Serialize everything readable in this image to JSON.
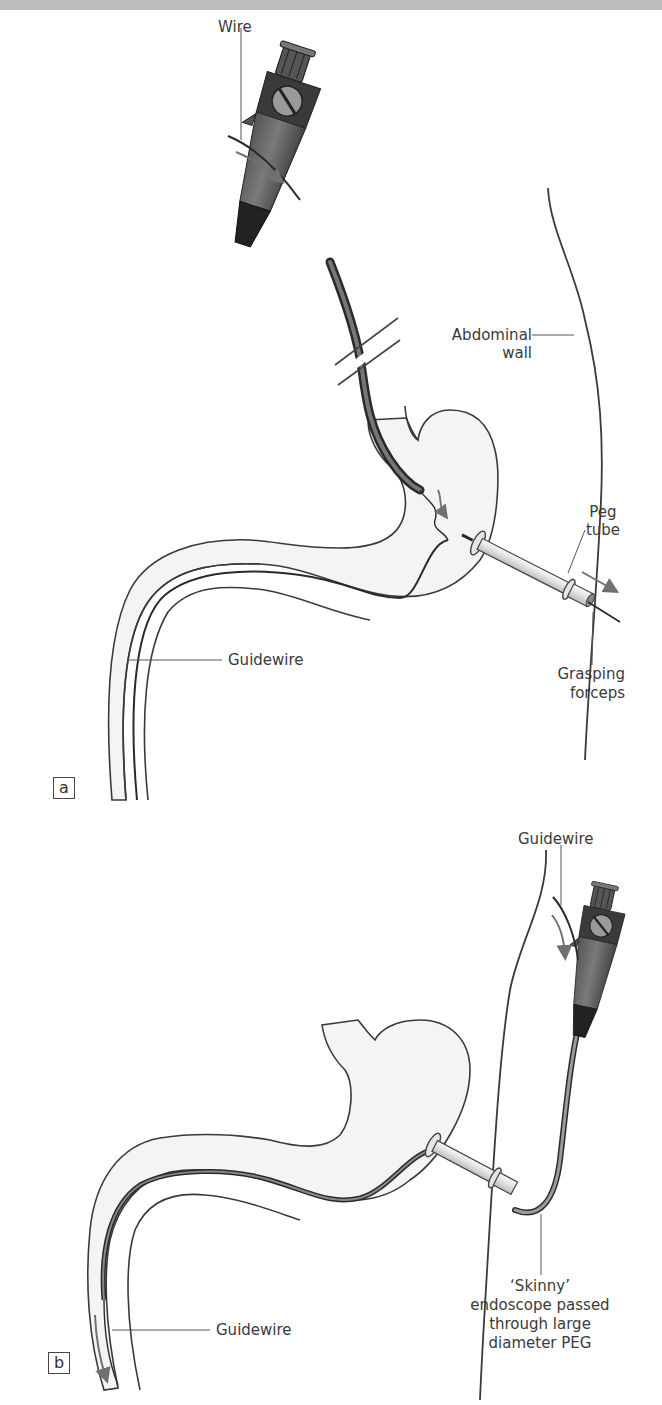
{
  "figure": {
    "panels": [
      {
        "id": "a",
        "tag": "a",
        "labels": {
          "wire": "Wire",
          "abdominal_wall_line1": "Abdominal",
          "abdominal_wall_line2": "wall",
          "peg_tube_line1": "Peg",
          "peg_tube_line2": "tube",
          "grasping_forceps_line1": "Grasping",
          "grasping_forceps_line2": "forceps",
          "guidewire": "Guidewire"
        }
      },
      {
        "id": "b",
        "tag": "b",
        "labels": {
          "guidewire_top": "Guidewire",
          "guidewire_bottom": "Guidewire",
          "skinny_line1": "‘Skinny’",
          "skinny_line2": "endoscope passed",
          "skinny_line3": "through large",
          "skinny_line4": "diameter PEG"
        }
      }
    ],
    "colors": {
      "outline": "#3a3a3a",
      "organ_fill": "#f4f4f4",
      "scope_dark": "#2e2e2e",
      "scope_mid": "#6e6e6e",
      "tube_fill": "#e2e2e2",
      "arrow": "#707070",
      "top_bar": "#bdbdbd"
    }
  }
}
